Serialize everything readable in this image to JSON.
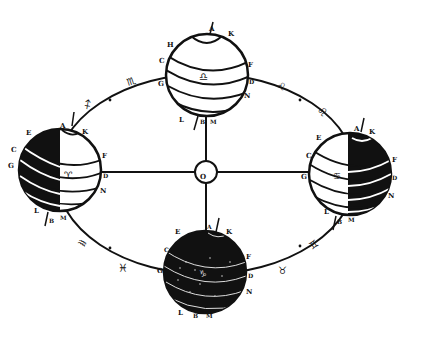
{
  "center": {
    "label": "O",
    "x": 206,
    "y": 172,
    "r": 11
  },
  "orbit": {
    "cx": 206,
    "cy": 174,
    "rx": 150,
    "ry": 100
  },
  "colors": {
    "ink": "#111111",
    "paper": "#ffffff"
  },
  "globes": [
    {
      "id": "top",
      "cx": 207,
      "cy": 75,
      "r": 41,
      "shade": "none",
      "center_sign": "♎",
      "labels": {
        "A": "A",
        "K": "K",
        "H": "H",
        "C": "C",
        "G": "G",
        "F": "F",
        "D": "D",
        "N": "N",
        "L": "L",
        "B": "B",
        "M": "M"
      }
    },
    {
      "id": "left",
      "cx": 60,
      "cy": 170,
      "r": 41,
      "shade": "left",
      "center_sign": "♈",
      "labels": {
        "A": "A",
        "K": "K",
        "E": "E",
        "C": "C",
        "G": "G",
        "F": "F",
        "D": "D",
        "N": "N",
        "L": "L",
        "B": "B",
        "M": "M"
      }
    },
    {
      "id": "right",
      "cx": 350,
      "cy": 174,
      "r": 41,
      "shade": "right",
      "center_sign": "♋",
      "labels": {
        "A": "A",
        "K": "K",
        "E": "E",
        "C": "C",
        "G": "G",
        "F": "F",
        "D": "D",
        "N": "N",
        "L": "L",
        "B": "B",
        "M": "M"
      }
    },
    {
      "id": "bottom",
      "cx": 205,
      "cy": 272,
      "r": 41,
      "shade": "full",
      "center_sign": "♑",
      "labels": {
        "A": "A",
        "K": "K",
        "E": "E",
        "C": "C",
        "G": "G",
        "F": "F",
        "D": "D",
        "N": "N",
        "L": "L",
        "B": "B",
        "M": "M"
      }
    }
  ],
  "zodiac_signs": [
    {
      "glyph": "♏",
      "x": 138,
      "y": 82,
      "name": "scorpio"
    },
    {
      "glyph": "♐",
      "x": 92,
      "y": 106,
      "name": "sagittarius"
    },
    {
      "glyph": "♌",
      "x": 280,
      "y": 84,
      "name": "leo"
    },
    {
      "glyph": "♌",
      "x": 320,
      "y": 108,
      "name": "leo-2"
    },
    {
      "glyph": "♒",
      "x": 84,
      "y": 240,
      "name": "aquarius"
    },
    {
      "glyph": "♓",
      "x": 126,
      "y": 268,
      "name": "pisces"
    },
    {
      "glyph": "♊",
      "x": 318,
      "y": 246,
      "name": "gemini"
    },
    {
      "glyph": "♉",
      "x": 282,
      "y": 270,
      "name": "taurus"
    }
  ]
}
